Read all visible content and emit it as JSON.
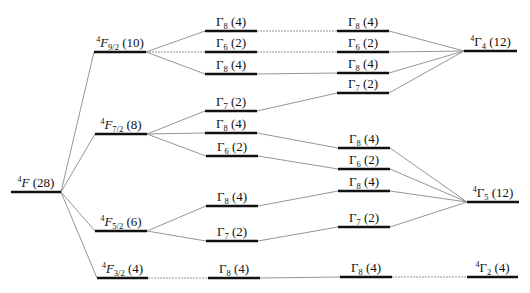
{
  "diagram": {
    "title": "",
    "colors": {
      "level": "#111111",
      "connector": "#8a8a8a",
      "text": "#111111"
    },
    "columns": [
      {
        "name": "free-ion-term",
        "levels": [
          {
            "id": "F",
            "sup": "4",
            "main": "F",
            "sub": "",
            "deg": "(28)",
            "x1": 11,
            "x2": 61,
            "y": 192,
            "italic": true
          }
        ]
      },
      {
        "name": "spin-orbit-levels",
        "levels": [
          {
            "id": "F92",
            "sup": "4",
            "main": "F",
            "sub": "9/2",
            "deg": "(10)",
            "x1": 94,
            "x2": 146,
            "y": 52,
            "italic": true
          },
          {
            "id": "F72",
            "sup": "4",
            "main": "F",
            "sub": "7/2",
            "deg": "(8)",
            "x1": 95,
            "x2": 147,
            "y": 134,
            "italic": true
          },
          {
            "id": "F52",
            "sup": "4",
            "main": "F",
            "sub": "5/2",
            "deg": "(6)",
            "x1": 95,
            "x2": 147,
            "y": 231,
            "italic": true
          },
          {
            "id": "F32",
            "sup": "4",
            "main": "F",
            "sub": "3/2",
            "deg": "(4)",
            "x1": 97,
            "x2": 148,
            "y": 278,
            "italic": true
          }
        ]
      },
      {
        "name": "crystal-field-levels-left",
        "levels": [
          {
            "id": "a1",
            "sup": "",
            "main": "Γ",
            "sub": "8",
            "deg": "(4)",
            "x1": 205,
            "x2": 257,
            "y": 31
          },
          {
            "id": "a2",
            "sup": "",
            "main": "Γ",
            "sub": "6",
            "deg": "(2)",
            "x1": 205,
            "x2": 257,
            "y": 52
          },
          {
            "id": "a3",
            "sup": "",
            "main": "Γ",
            "sub": "8",
            "deg": "(4)",
            "x1": 205,
            "x2": 257,
            "y": 74
          },
          {
            "id": "a4",
            "sup": "",
            "main": "Γ",
            "sub": "7",
            "deg": "(2)",
            "x1": 205,
            "x2": 257,
            "y": 111
          },
          {
            "id": "a5",
            "sup": "",
            "main": "Γ",
            "sub": "8",
            "deg": "(4)",
            "x1": 205,
            "x2": 257,
            "y": 133
          },
          {
            "id": "a6",
            "sup": "",
            "main": "Γ",
            "sub": "6",
            "deg": "(2)",
            "x1": 206,
            "x2": 258,
            "y": 156
          },
          {
            "id": "a7",
            "sup": "",
            "main": "Γ",
            "sub": "8",
            "deg": "(4)",
            "x1": 206,
            "x2": 258,
            "y": 206
          },
          {
            "id": "a8",
            "sup": "",
            "main": "Γ",
            "sub": "7",
            "deg": "(2)",
            "x1": 206,
            "x2": 258,
            "y": 241
          },
          {
            "id": "a9",
            "sup": "",
            "main": "Γ",
            "sub": "8",
            "deg": "(4)",
            "x1": 208,
            "x2": 260,
            "y": 278
          }
        ]
      },
      {
        "name": "crystal-field-levels-right",
        "levels": [
          {
            "id": "b1",
            "sup": "",
            "main": "Γ",
            "sub": "8",
            "deg": "(4)",
            "x1": 337,
            "x2": 389,
            "y": 31
          },
          {
            "id": "b2",
            "sup": "",
            "main": "Γ",
            "sub": "6",
            "deg": "(2)",
            "x1": 337,
            "x2": 389,
            "y": 52
          },
          {
            "id": "b3",
            "sup": "",
            "main": "Γ",
            "sub": "8",
            "deg": "(4)",
            "x1": 337,
            "x2": 389,
            "y": 73
          },
          {
            "id": "b4",
            "sup": "",
            "main": "Γ",
            "sub": "7",
            "deg": "(2)",
            "x1": 337,
            "x2": 389,
            "y": 93
          },
          {
            "id": "b5",
            "sup": "",
            "main": "Γ",
            "sub": "8",
            "deg": "(4)",
            "x1": 338,
            "x2": 390,
            "y": 148
          },
          {
            "id": "b6",
            "sup": "",
            "main": "Γ",
            "sub": "6",
            "deg": "(2)",
            "x1": 338,
            "x2": 390,
            "y": 169
          },
          {
            "id": "b7",
            "sup": "",
            "main": "Γ",
            "sub": "8",
            "deg": "(4)",
            "x1": 338,
            "x2": 390,
            "y": 191
          },
          {
            "id": "b8",
            "sup": "",
            "main": "Γ",
            "sub": "7",
            "deg": "(2)",
            "x1": 338,
            "x2": 390,
            "y": 227
          },
          {
            "id": "b9",
            "sup": "",
            "main": "Γ",
            "sub": "8",
            "deg": "(4)",
            "x1": 340,
            "x2": 392,
            "y": 277
          }
        ]
      },
      {
        "name": "cubic-field-terms",
        "levels": [
          {
            "id": "G4",
            "sup": "4",
            "main": "Γ",
            "sub": "4",
            "deg": "(12)",
            "x1": 464,
            "x2": 517,
            "y": 51
          },
          {
            "id": "G5",
            "sup": "4",
            "main": "Γ",
            "sub": "5",
            "deg": "(12)",
            "x1": 467,
            "x2": 519,
            "y": 202
          },
          {
            "id": "G2",
            "sup": "4",
            "main": "Γ",
            "sub": "2",
            "deg": "(4)",
            "x1": 467,
            "x2": 518,
            "y": 277
          }
        ]
      }
    ],
    "connections": [
      [
        "F",
        "F92"
      ],
      [
        "F",
        "F72"
      ],
      [
        "F",
        "F52"
      ],
      [
        "F",
        "F32"
      ],
      [
        "F92",
        "a1"
      ],
      [
        "F92",
        "a2"
      ],
      [
        "F92",
        "a3"
      ],
      [
        "F72",
        "a4"
      ],
      [
        "F72",
        "a5"
      ],
      [
        "F72",
        "a6"
      ],
      [
        "F52",
        "a7"
      ],
      [
        "F52",
        "a8"
      ],
      [
        "F32",
        "a9"
      ],
      [
        "a1",
        "b1"
      ],
      [
        "a2",
        "b2"
      ],
      [
        "a3",
        "b3"
      ],
      [
        "a4",
        "b4"
      ],
      [
        "a5",
        "b5"
      ],
      [
        "a6",
        "b6"
      ],
      [
        "a7",
        "b7"
      ],
      [
        "a8",
        "b8"
      ],
      [
        "a9",
        "b9"
      ],
      [
        "b1",
        "G4"
      ],
      [
        "b2",
        "G4"
      ],
      [
        "b3",
        "G4"
      ],
      [
        "b4",
        "G4"
      ],
      [
        "b5",
        "G5"
      ],
      [
        "b6",
        "G5"
      ],
      [
        "b7",
        "G5"
      ],
      [
        "b8",
        "G5"
      ],
      [
        "b9",
        "G2"
      ]
    ]
  }
}
